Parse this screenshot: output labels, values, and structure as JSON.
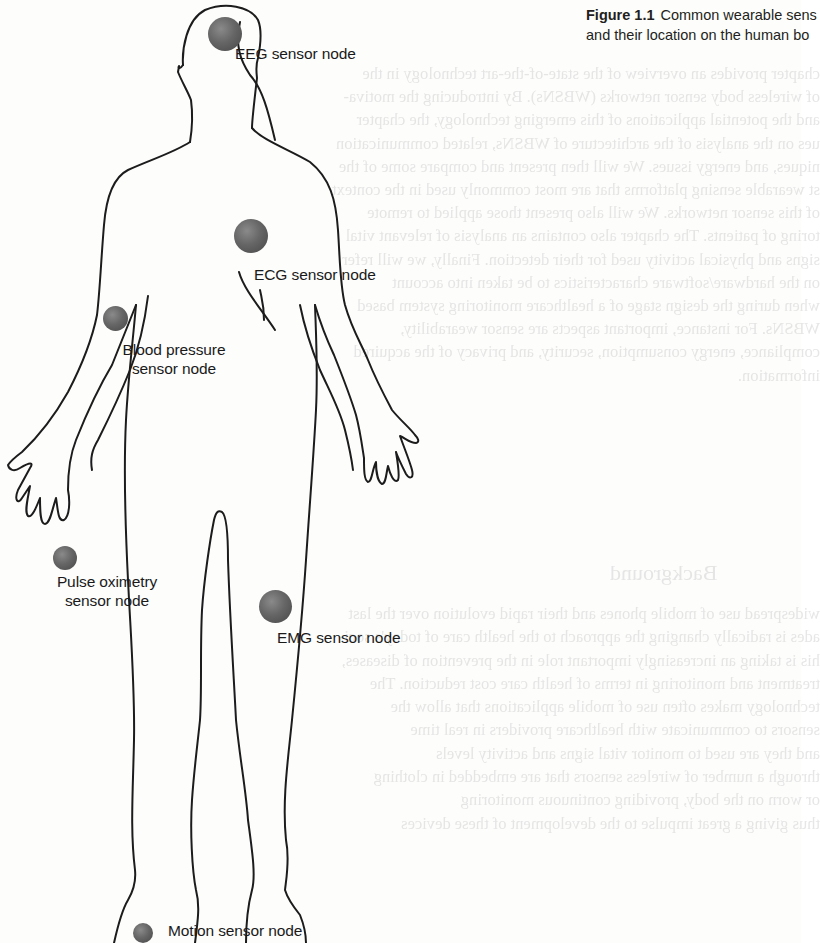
{
  "caption": {
    "figure_number": "Figure 1.1",
    "text_line1": "Common wearable sens",
    "text_line2": "and their location on the human bo"
  },
  "diagram": {
    "nodes": [
      {
        "id": "eeg",
        "label": "EEG sensor node",
        "location": "head"
      },
      {
        "id": "ecg",
        "label": "ECG sensor node",
        "location": "chest"
      },
      {
        "id": "blood_pressure",
        "label_line1": "Blood pressure",
        "label_line2": "sensor node",
        "location": "upper arm"
      },
      {
        "id": "pulse_oximetry",
        "label_line1": "Pulse oximetry",
        "label_line2": "sensor node",
        "location": "fingertip"
      },
      {
        "id": "emg",
        "label": "EMG sensor node",
        "location": "thigh"
      },
      {
        "id": "motion",
        "label": "Motion sensor node",
        "location": "ankle"
      }
    ],
    "node_color": "#5a5a5a",
    "outline_color": "#1a1a1a"
  },
  "background_bleed": {
    "heading": "Background",
    "lines_top": [
      "chapter provides an overview of the state-of-the-art technology in the",
      "of wireless body sensor networks (WBSNs). By introducing the motiva-",
      "and the potential applications of this emerging technology, the chapter",
      "ues on the analysis of the architecture of WBSNs, related communication",
      "niques, and energy issues. We will then present and compare some of the",
      "st wearable sensing platforms that are most commonly used in the context",
      "of this sensor networks. We will also present those applied to remote",
      "toring of patients. The chapter also contains an analysis of relevant vital",
      "signs and physical activity used for their detection. Finally, we will refer",
      "on the hardware/software characteristics to be taken into account",
      "when during the design stage of a healthcare monitoring system based",
      "WBSNs. For instance, important aspects are sensor wearability,",
      "compliance, energy consumption, security, and privacy of the acquired",
      "information."
    ],
    "lines_bottom": [
      "widespread use of mobile phones and their rapid evolution over the last",
      "ades is radically changing the approach to the health care of today's soci-",
      "his is taking an increasingly important role in the prevention of diseases,",
      "treatment and monitoring in terms of health care cost reduction. The",
      "technology makes often use of mobile applications that allow the",
      "sensors to communicate with healthcare providers in real time",
      "and they are used to monitor vital signs and activity levels",
      "through a number of wireless sensors that are embedded in clothing",
      "or worn on the body, providing continuous monitoring",
      "thus giving a great impulse to the development of these devices"
    ]
  }
}
